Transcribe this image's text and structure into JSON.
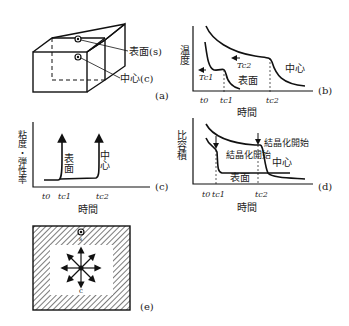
{
  "panels": {
    "a": {
      "label": "(a)",
      "surface_label": "表面(s)",
      "center_label": "中心(c)"
    },
    "b": {
      "label": "(b)",
      "ylabel": "温度",
      "xlabel": "時間",
      "ticks": [
        "t0",
        "tc1",
        "tc2"
      ],
      "tc1_label": "Tc1",
      "tc2_label": "Tc2",
      "surface_label": "表面",
      "center_label": "中心"
    },
    "c": {
      "label": "(c)",
      "ylabel": "粘度・弾性率",
      "xlabel": "時間",
      "ticks": [
        "t0",
        "tc1",
        "tc2"
      ],
      "surface_label": "表面",
      "center_label": "中心"
    },
    "d": {
      "label": "(d)",
      "ylabel": "比容積",
      "xlabel": "時間",
      "ticks": [
        "t0",
        "tc1",
        "tc2"
      ],
      "cryst_start_inner": "結晶化開始",
      "cryst_start_outer": "結晶化開始",
      "surface_label": "表面",
      "center_label": "中心"
    },
    "e": {
      "label": "(e)",
      "s_label": "s",
      "c_label": "c"
    }
  }
}
